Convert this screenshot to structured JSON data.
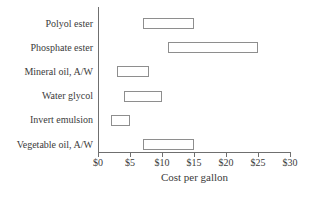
{
  "figure": {
    "background": "#ffffff",
    "axis_color": "#6f6f6f",
    "bar_border_color": "#8e8e8e",
    "text_color": "#3b3b3b"
  },
  "chart_data": {
    "type": "bar",
    "orientation": "horizontal",
    "style": "floating range bars, unfilled white with gray outline",
    "title": "",
    "xlabel": "Cost per gallon",
    "ylabel": "",
    "xlim": [
      0,
      30
    ],
    "x_ticks": [
      0,
      5,
      10,
      15,
      20,
      25,
      30
    ],
    "x_tick_labels": [
      "$0",
      "$5",
      "$10",
      "$15",
      "$20",
      "$25",
      "$30"
    ],
    "grid": false,
    "legend": false,
    "categories": [
      "Polyol ester",
      "Phosphate ester",
      "Mineral oil, A/W",
      "Water glycol",
      "Invert emulsion",
      "Vegetable oil, A/W"
    ],
    "series": [
      {
        "name": "Cost range ($ per gallon)",
        "ranges": [
          {
            "low": 7,
            "high": 15
          },
          {
            "low": 11,
            "high": 25
          },
          {
            "low": 3,
            "high": 8
          },
          {
            "low": 4,
            "high": 10
          },
          {
            "low": 2,
            "high": 5
          },
          {
            "low": 7,
            "high": 15
          }
        ]
      }
    ]
  }
}
